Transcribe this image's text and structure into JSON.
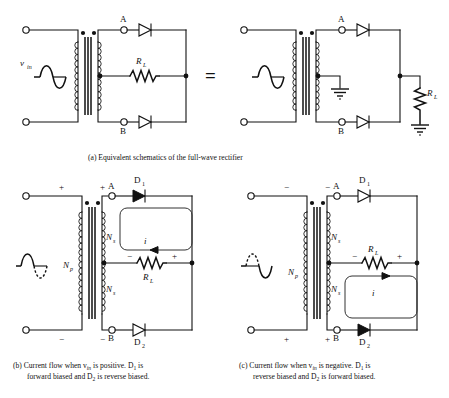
{
  "figure": {
    "type": "circuit-schematic-diagram",
    "background": "#ffffff",
    "ink_color": "#111111"
  },
  "panels": [
    {
      "id": "a",
      "caption": "(a) Equivalent schematics of the full-wave rectifier",
      "equals_sign": "=",
      "left_circuit": {
        "source_label": "v",
        "source_sub": "in",
        "node_a": "A",
        "node_b": "B",
        "load_label": "R",
        "load_sub": "L",
        "load_orientation": "horizontal",
        "diode_d1_style": "outline",
        "diode_d2_style": "outline",
        "has_ground": false
      },
      "right_circuit": {
        "node_a": "A",
        "node_b": "B",
        "load_label": "R",
        "load_sub": "L",
        "load_orientation": "vertical",
        "diode_d1_style": "outline",
        "diode_d2_style": "outline",
        "has_ground": true,
        "ground_count": 2
      }
    },
    {
      "id": "b",
      "caption_line1": "(b) Current flow when v",
      "caption_sub": "in",
      "caption_line2": " is positive. D",
      "caption_sub2": "1",
      "caption_line3": " is",
      "caption_line4": "forward biased and D",
      "caption_sub3": "2",
      "caption_line5": " is reverse biased.",
      "primary_label": "N",
      "primary_sub": "p",
      "secondary_label_top": "N",
      "secondary_sub_top": "s",
      "secondary_label_bottom": "N",
      "secondary_sub_bottom": "s",
      "node_a": "A",
      "node_b": "B",
      "diode_d1": "D",
      "diode_d1_sub": "1",
      "diode_d1_style": "filled",
      "diode_d2": "D",
      "diode_d2_sub": "2",
      "diode_d2_style": "outline",
      "load_label": "R",
      "load_sub": "L",
      "current_label": "i",
      "current_loop_position": "above-load",
      "current_arrow_direction": "left",
      "waveform": "positive-half-solid",
      "polarity_in_top": "+",
      "polarity_in_bottom": "−",
      "polarity_sec_top": "+",
      "polarity_sec_bottom": "−",
      "load_polarity_left": "−",
      "load_polarity_right": "+"
    },
    {
      "id": "c",
      "caption_line1": "(c) Current flow when v",
      "caption_sub": "in",
      "caption_line2": " is negative. D",
      "caption_sub2": "1",
      "caption_line3": " is",
      "caption_line4": "reverse biased and D",
      "caption_sub3": "2",
      "caption_line5": " is forward biased.",
      "primary_label": "N",
      "primary_sub": "p",
      "secondary_label_top": "N",
      "secondary_sub_top": "s",
      "secondary_label_bottom": "N",
      "secondary_sub_bottom": "s",
      "node_a": "A",
      "node_b": "B",
      "diode_d1": "D",
      "diode_d1_sub": "1",
      "diode_d1_style": "outline",
      "diode_d2": "D",
      "diode_d2_sub": "2",
      "diode_d2_style": "filled",
      "load_label": "R",
      "load_sub": "L",
      "current_label": "i",
      "current_loop_position": "below-load",
      "current_arrow_direction": "right",
      "waveform": "negative-half-solid",
      "polarity_in_top": "−",
      "polarity_in_bottom": "+",
      "polarity_sec_top": "−",
      "polarity_sec_bottom": "+",
      "load_polarity_left": "−",
      "load_polarity_right": "+"
    }
  ],
  "captions": {
    "a": "(a) Equivalent schematics of the full-wave rectifier",
    "b_l1": "(b) Current flow when v",
    "b_l1b": " is positive. D",
    "b_l1c": " is",
    "b_l2": "forward biased and D",
    "b_l2b": " is reverse biased.",
    "c_l1": "(c) Current flow when v",
    "c_l1b": " is negative. D",
    "c_l1c": " is",
    "c_l2": "reverse biased and D",
    "c_l2b": " is forward biased."
  }
}
